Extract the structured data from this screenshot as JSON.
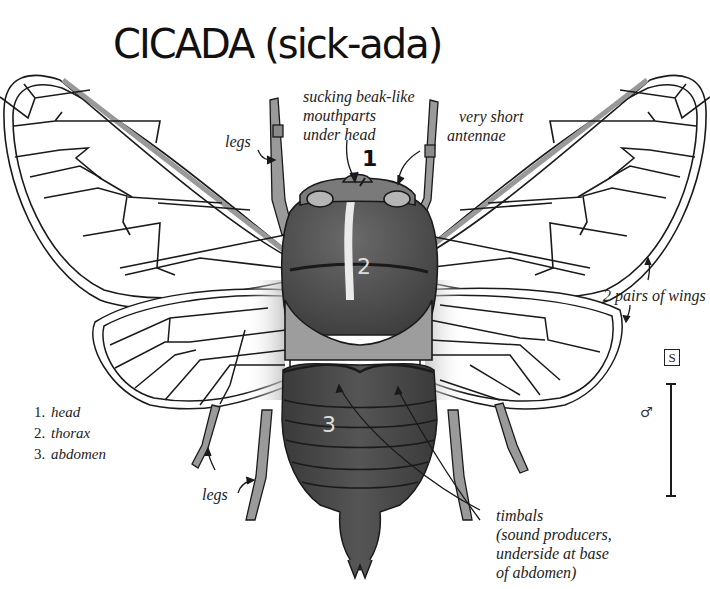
{
  "title": "CICADA (sick-ada)",
  "annotations": {
    "mouthparts": [
      "sucking beak-like",
      "mouthparts",
      "under head"
    ],
    "antennae": [
      "very short",
      "antennae"
    ],
    "legs_upper": "legs",
    "legs_lower": "legs",
    "wings": "2 pairs of wings",
    "timbals": [
      "timbals",
      "(sound producers,",
      "underside at base",
      "of abdomen)"
    ]
  },
  "body_part_numbers": {
    "head": "1",
    "thorax": "2",
    "abdomen": "3"
  },
  "legend": [
    {
      "num": "1.",
      "label": "head"
    },
    {
      "num": "2.",
      "label": "thorax"
    },
    {
      "num": "3.",
      "label": "abdomen"
    }
  ],
  "scale": {
    "size_code": "S",
    "sex_symbol": "♂"
  },
  "colors": {
    "ink": "#1a1a1a",
    "body_dark": "#4a4a4a",
    "body_mid": "#7a7a7a",
    "leg_gray": "#9a9a9a",
    "wing_fill": "#ffffff",
    "costa_gray": "#b5b5b5"
  }
}
